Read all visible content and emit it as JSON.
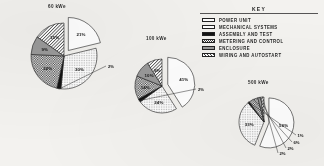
{
  "figure": {
    "key_title": "KEY"
  },
  "legend": {
    "items": [
      {
        "label": "POWER UNIT",
        "pattern": "white"
      },
      {
        "label": "MECHANICAL SYSTEMS",
        "pattern": "dots"
      },
      {
        "label": "ASSEMBLY AND TEST",
        "pattern": "black"
      },
      {
        "label": "METERING AND CONTROL",
        "pattern": "check"
      },
      {
        "label": "ENCLOSURE",
        "pattern": "gray"
      },
      {
        "label": "WIRING AND AUTOSTART",
        "pattern": "diag"
      }
    ]
  },
  "chart_data": [
    {
      "type": "pie",
      "title": "60 kWe",
      "categories": [
        "POWER UNIT",
        "MECHANICAL SYSTEMS",
        "ASSEMBLY AND TEST",
        "METERING AND CONTROL",
        "ENCLOSURE",
        "WIRING AND AUTOSTART"
      ],
      "values": [
        21,
        30,
        2,
        22,
        9,
        15
      ],
      "labels": [
        "21%",
        "30%",
        "2%",
        "22%",
        "9%",
        "15%"
      ],
      "exploded": [
        "POWER UNIT"
      ],
      "legend_position": "right"
    },
    {
      "type": "pie",
      "title": "100 kWe",
      "categories": [
        "POWER UNIT",
        "MECHANICAL SYSTEMS",
        "ASSEMBLY AND TEST",
        "METERING AND CONTROL",
        "ENCLOSURE",
        "WIRING AND AUTOSTART"
      ],
      "values": [
        41,
        24,
        2,
        14,
        10,
        9
      ],
      "labels": [
        "41%",
        "24%",
        "2%",
        "14%",
        "10%",
        "9%"
      ],
      "exploded": [
        "POWER UNIT"
      ],
      "legend_position": "right"
    },
    {
      "type": "pie",
      "title": "500 kWe",
      "categories": [
        "POWER UNIT",
        "MECHANICAL SYSTEMS",
        "ASSEMBLY AND TEST",
        "METERING AND CONTROL",
        "ENCLOSURE",
        "WIRING AND AUTOSTART"
      ],
      "values": [
        56,
        33,
        1,
        6,
        2,
        2
      ],
      "labels": [
        "56%",
        "33%",
        "1%",
        "6%",
        "2%",
        "2%"
      ],
      "exploded": [
        "POWER UNIT"
      ],
      "legend_position": "right"
    }
  ]
}
